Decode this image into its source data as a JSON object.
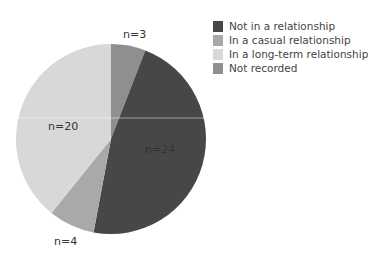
{
  "chart_data": {
    "type": "pie",
    "title": "",
    "start_angle_deg": 0,
    "direction": "clockwise",
    "slices": [
      {
        "name": "Not recorded",
        "value": 3,
        "label": "n=3",
        "color": "#8f8f8f"
      },
      {
        "name": "Not in a relationship",
        "value": 24,
        "label": "n=24",
        "color": "#474747"
      },
      {
        "name": "In a casual relationship",
        "value": 4,
        "label": "n=4",
        "color": "#a9a9a9"
      },
      {
        "name": "In a long-term relationship",
        "value": 20,
        "label": "n=20",
        "color": "#d8d8d8"
      }
    ],
    "legend": {
      "position": "right",
      "entries": [
        {
          "label": "Not in a relationship",
          "color": "#474747"
        },
        {
          "label": "In a casual relationship",
          "color": "#a9a9a9"
        },
        {
          "label": "In a long-term relationship",
          "color": "#d8d8d8"
        },
        {
          "label": "Not recorded",
          "color": "#8f8f8f"
        }
      ]
    }
  },
  "labels": {
    "n3": "n=3",
    "n24": "n=24",
    "n4": "n=4",
    "n20": "n=20"
  },
  "legend": {
    "items": [
      {
        "label": "Not in a relationship"
      },
      {
        "label": "In a casual relationship"
      },
      {
        "label": "In a long-term relationship"
      },
      {
        "label": "Not recorded"
      }
    ]
  }
}
